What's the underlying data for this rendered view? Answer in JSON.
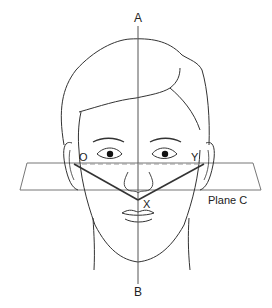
{
  "diagram": {
    "labels": {
      "top_axis": "A",
      "bottom_axis": "B",
      "left_point": "O",
      "right_point": "Y",
      "apex_point": "X",
      "plane": "Plane C"
    },
    "colors": {
      "line": "#333333",
      "plane": "#777777",
      "dashed": "#999999",
      "background": "#ffffff"
    }
  }
}
